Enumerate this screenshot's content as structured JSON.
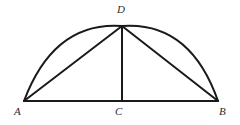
{
  "figure": {
    "background_color": "#ffffff",
    "stroke_color": "#1a1a1a",
    "label_color": "#2b2b2b",
    "stroke_width": 2,
    "vertices": [
      {
        "id": "A",
        "label": "A",
        "x": 24,
        "y": 101,
        "label_x": 14,
        "label_y": 106
      },
      {
        "id": "B",
        "label": "B",
        "x": 218,
        "y": 101,
        "label_x": 219,
        "label_y": 106
      },
      {
        "id": "C",
        "label": "C",
        "x": 122,
        "y": 101,
        "label_x": 115,
        "label_y": 106
      },
      {
        "id": "D",
        "label": "D",
        "x": 122,
        "y": 26,
        "label_x": 117,
        "label_y": 4
      }
    ],
    "segments": [
      {
        "id": "AB",
        "name": "baseline-segment-ab",
        "from": "A",
        "to": "B"
      },
      {
        "id": "AD",
        "name": "segment-ad",
        "from": "A",
        "to": "D"
      },
      {
        "id": "DB",
        "name": "segment-db",
        "from": "D",
        "to": "B"
      },
      {
        "id": "DC",
        "name": "altitude-segment-dc",
        "from": "D",
        "to": "C"
      }
    ],
    "arc": {
      "id": "ADB",
      "name": "arc-a-d-b",
      "from": "A",
      "to": "B",
      "apex": "D",
      "path": "M 24 101 Q 54 21 122 26 Q 190 21 218 101"
    }
  }
}
